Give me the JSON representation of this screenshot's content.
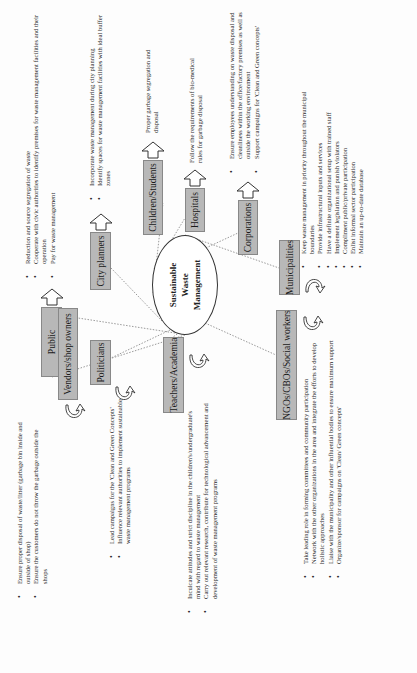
{
  "center": {
    "line1": "Sustainable",
    "line2": "Waste",
    "line3": "Management"
  },
  "stakeholders": {
    "public": {
      "label": "Public",
      "items": [
        "Reduction and source segregation of waste",
        "Cooperate with civic authorities to identify premises for waste management facilities and their operation",
        "Pay for waste management"
      ]
    },
    "city_planners": {
      "label": "City planners",
      "items": [
        "Incorporate waste management during city planning",
        "Identify spaces for waste management facilities with ideal buffer zones"
      ]
    },
    "children_students": {
      "label": "Children/Students",
      "items": [
        "Proper garbage segregation and disposal"
      ]
    },
    "hospitals": {
      "label": "Hospitals",
      "items": [
        "Follow the requirements of bio-medical rules for garbage disposal"
      ]
    },
    "corporations": {
      "label": "Corporations",
      "items": [
        "Ensure employees understanding on waste disposal and cleanliness within the office/factory premises as well as outside the working environment",
        "Support campaigns for 'Clean and Green concepts'"
      ]
    },
    "municipalities": {
      "label": "Municipalities",
      "items": [
        "Keep waste management in priority throughout the municipal boundaries",
        "Provide infrastructural inputs and services",
        "Have a definite organizational setup with trained staff",
        "Implement legislation and punish violators",
        "Compliment public/private participation",
        "Enlist informal sector participation",
        "Maintain an up-to-date database"
      ]
    },
    "vendors": {
      "label": "Vendors/shop owners",
      "items": [
        "Ensure proper disposal of waste/litter (garbage bin inside and outside of shop)",
        "Ensure the customers do not throw the garbage outside the shops"
      ]
    },
    "politicians": {
      "label": "Politicians",
      "items": [
        "Lead campaigns for the 'Clean and Green Concepts'",
        "Influence relevant authorities to implement sustainable waste management programs"
      ]
    },
    "teachers": {
      "label": "Teachers/Academia",
      "items": [
        "Inculcate attitudes and strict discipline in the children's/undergraduate's mind with regard to waste management",
        "Carry out relevant research, contribute for technological advancement and development of waste management programs"
      ]
    },
    "ngos": {
      "label": "NGOs/CBOs/Social workers",
      "items": [
        "Take leading role in forming committees and community participation",
        "Network with the other organizations in the area and integrate the efforts to develop holistic approaches",
        "Liaise with the municipality and other influential bodies to ensure maximum support",
        "Organize/sponsor for campaigns on 'Clean/ Green concepts'"
      ]
    }
  },
  "bullet": "•",
  "colors": {
    "box_fill": "#b8b8b8",
    "box_border": "#888888",
    "connector": "#9a9a9a",
    "text": "#222222"
  }
}
